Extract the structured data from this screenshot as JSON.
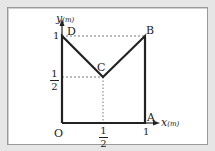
{
  "figure": {
    "colors": {
      "background": "#e6e6e6",
      "panel": "#ffffff",
      "line": "#222222",
      "dashed": "#555555"
    },
    "axes": {
      "x_label": "x",
      "x_unit": "(m)",
      "y_label": "y",
      "y_unit": "(m)",
      "origin_label": "O",
      "x_ticks": [
        {
          "num": "1",
          "den": "2"
        },
        "1"
      ],
      "y_ticks": [
        {
          "num": "1",
          "den": "2"
        },
        "1"
      ]
    },
    "points": [
      {
        "name": "O",
        "x": 0,
        "y": 0
      },
      {
        "name": "A",
        "x": 1,
        "y": 0
      },
      {
        "name": "B",
        "x": 1,
        "y": 1
      },
      {
        "name": "C",
        "x": 0.5,
        "y": 0.5
      },
      {
        "name": "D",
        "x": 0,
        "y": 1
      }
    ],
    "path": [
      "O",
      "A",
      "B",
      "C",
      "D",
      "O"
    ],
    "point_labels": {
      "A": "A",
      "B": "B",
      "C": "C",
      "D": "D"
    }
  }
}
